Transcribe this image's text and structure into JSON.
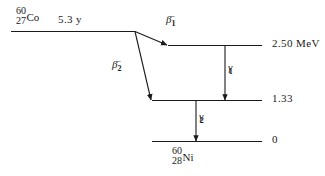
{
  "diagram": {
    "stroke_color": "#1a1a1a",
    "background_color": "#ffffff",
    "parent": {
      "mass_number": "60",
      "atomic_number": "27",
      "symbol": "Co",
      "half_life": "5.3 y"
    },
    "daughter": {
      "mass_number": "60",
      "atomic_number": "28",
      "symbol": "Ni"
    },
    "levels": [
      {
        "id": "parent",
        "label": "",
        "energy_text": ""
      },
      {
        "id": "excited-2",
        "label": "2.50 MeV",
        "energy_text": "2.50 MeV"
      },
      {
        "id": "excited-1",
        "label": "1.33",
        "energy_text": "1.33"
      },
      {
        "id": "ground",
        "label": "0",
        "energy_text": "0"
      }
    ],
    "transitions": [
      {
        "id": "beta1",
        "particle": "β",
        "superscript": "−",
        "subscript": "1",
        "from": "parent",
        "to": "excited-2"
      },
      {
        "id": "beta2",
        "particle": "β",
        "superscript": "−",
        "subscript": "2",
        "from": "parent",
        "to": "excited-1"
      },
      {
        "id": "gamma1",
        "particle": "γ",
        "superscript": "",
        "subscript": "1",
        "from": "excited-2",
        "to": "excited-1"
      },
      {
        "id": "gamma2",
        "particle": "γ",
        "superscript": "",
        "subscript": "2",
        "from": "excited-1",
        "to": "ground"
      }
    ]
  }
}
